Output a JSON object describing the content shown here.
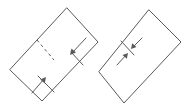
{
  "diagram": {
    "stroke_color": "#5a5a5a",
    "background": "#ffffff",
    "figures": [
      {
        "id": "step-1",
        "shape": "rotated-rectangle",
        "outline": [
          [
            67,
            8
          ],
          [
            98,
            42
          ],
          [
            42,
            101
          ],
          [
            10,
            70
          ]
        ],
        "valley_fold_line": [
          [
            37,
            40
          ],
          [
            54,
            60
          ]
        ],
        "fold_guides": [
          {
            "from": [
              71,
              52
            ],
            "to": [
              83,
              65
            ]
          },
          {
            "from": [
              38,
              76
            ],
            "to": [
              54,
              92
            ]
          }
        ],
        "arrows": [
          {
            "from": [
              86,
              38
            ],
            "to": [
              70,
              55
            ]
          },
          {
            "from": [
              32,
              93
            ],
            "to": [
              46,
              77
            ]
          }
        ]
      },
      {
        "id": "step-2",
        "shape": "rotated-rectangle",
        "outline": [
          [
            149,
            10
          ],
          [
            181,
            42
          ],
          [
            124,
            103
          ],
          [
            99,
            72
          ]
        ],
        "crease_line": [
          [
            121,
            41
          ],
          [
            134,
            55
          ]
        ],
        "arrows": [
          {
            "from": [
              142,
              38
            ],
            "to": [
              131,
              49
            ]
          },
          {
            "from": [
              117,
              65
            ],
            "to": [
              128,
              53
            ]
          }
        ]
      }
    ]
  }
}
